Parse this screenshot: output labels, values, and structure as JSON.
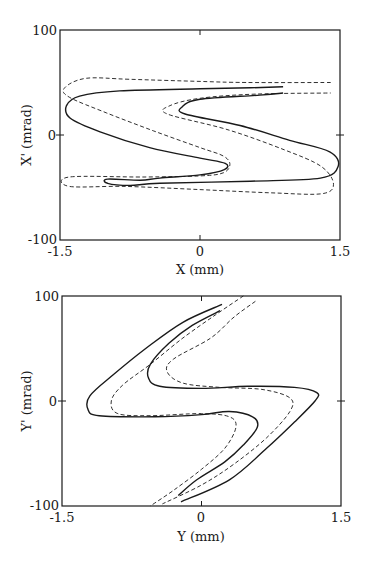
{
  "chart_data": [
    {
      "type": "line",
      "title": "",
      "xlabel": "X (mm)",
      "ylabel": "X' (mrad)",
      "xlim": [
        -1.5,
        1.5
      ],
      "ylim": [
        -100,
        100
      ],
      "xticks": [
        -1.5,
        0,
        1.5
      ],
      "xtick_labels": [
        "-1.5",
        "0",
        "1.5"
      ],
      "yticks": [
        -100,
        0,
        100
      ],
      "ytick_labels": [
        "-100",
        "0",
        "100"
      ],
      "grid": false,
      "legend": "none",
      "series": [
        {
          "name": "solid",
          "style": "solid",
          "points": [
            [
              0.89,
              46
            ],
            [
              0.54,
              45
            ],
            [
              0.0,
              44
            ],
            [
              -0.86,
              42
            ],
            [
              -1.29,
              37
            ],
            [
              -1.43,
              28
            ],
            [
              -1.39,
              16
            ],
            [
              -1.07,
              3
            ],
            [
              -0.54,
              -12
            ],
            [
              0.0,
              -22
            ],
            [
              0.27,
              -27
            ],
            [
              0.26,
              -33
            ],
            [
              0.0,
              -38
            ],
            [
              -0.43,
              -41
            ],
            [
              -0.64,
              -43
            ],
            [
              -0.99,
              -42
            ],
            [
              -0.99,
              -46
            ],
            [
              -0.75,
              -48
            ],
            [
              -0.43,
              -46
            ],
            [
              0.54,
              -44
            ],
            [
              1.29,
              -41
            ],
            [
              1.48,
              -30
            ],
            [
              1.39,
              -16
            ],
            [
              0.96,
              -5
            ],
            [
              0.43,
              9
            ],
            [
              -0.16,
              20
            ],
            [
              -0.19,
              27
            ],
            [
              0.0,
              34
            ],
            [
              0.64,
              38
            ],
            [
              0.89,
              40
            ]
          ]
        },
        {
          "name": "dashed",
          "style": "dashed",
          "points": [
            [
              1.4,
              50
            ],
            [
              0.5,
              50
            ],
            [
              0.0,
              51
            ],
            [
              -0.75,
              53
            ],
            [
              -1.22,
              54
            ],
            [
              -1.45,
              45
            ],
            [
              -1.4,
              36
            ],
            [
              -1.0,
              21
            ],
            [
              -0.5,
              4
            ],
            [
              0.0,
              -12
            ],
            [
              0.25,
              -20
            ],
            [
              0.32,
              -28
            ],
            [
              0.25,
              -36
            ],
            [
              0.0,
              -39
            ],
            [
              -0.6,
              -40
            ],
            [
              -1.4,
              -40
            ],
            [
              -1.4,
              -49
            ],
            [
              -0.8,
              -49
            ],
            [
              0.0,
              -52
            ],
            [
              0.75,
              -55
            ],
            [
              1.3,
              -56
            ],
            [
              1.43,
              -47
            ],
            [
              1.3,
              -30
            ],
            [
              0.9,
              -14
            ],
            [
              0.3,
              5
            ],
            [
              -0.35,
              20
            ],
            [
              -0.32,
              28
            ],
            [
              0.0,
              35
            ],
            [
              0.6,
              39
            ],
            [
              1.4,
              40
            ]
          ]
        }
      ]
    },
    {
      "type": "line",
      "title": "",
      "xlabel": "Y (mm)",
      "ylabel": "Y' (mrad)",
      "xlim": [
        -1.5,
        1.5
      ],
      "ylim": [
        -100,
        100
      ],
      "xticks": [
        -1.5,
        0,
        1.5
      ],
      "xtick_labels": [
        "-1.5",
        "0",
        "1.5"
      ],
      "yticks": [
        -100,
        0,
        100
      ],
      "ytick_labels": [
        "-100",
        "0",
        "100"
      ],
      "grid": false,
      "legend": "none",
      "series": [
        {
          "name": "solid",
          "style": "solid",
          "points": [
            [
              0.22,
              92
            ],
            [
              -0.2,
              75
            ],
            [
              -0.6,
              50
            ],
            [
              -0.95,
              25
            ],
            [
              -1.2,
              5
            ],
            [
              -1.22,
              -8
            ],
            [
              -1.1,
              -14
            ],
            [
              -0.5,
              -15
            ],
            [
              0.0,
              -13
            ],
            [
              0.3,
              -10
            ],
            [
              0.55,
              -15
            ],
            [
              0.6,
              -25
            ],
            [
              0.45,
              -42
            ],
            [
              0.25,
              -58
            ],
            [
              -0.05,
              -75
            ],
            [
              -0.25,
              -90
            ]
          ]
        },
        {
          "name": "solid-2",
          "style": "solid",
          "points": [
            [
              0.2,
              86
            ],
            [
              -0.1,
              72
            ],
            [
              -0.35,
              55
            ],
            [
              -0.55,
              35
            ],
            [
              -0.57,
              22
            ],
            [
              -0.45,
              14
            ],
            [
              0.0,
              12
            ],
            [
              0.5,
              14
            ],
            [
              1.0,
              13
            ],
            [
              1.24,
              8
            ],
            [
              1.22,
              0
            ],
            [
              1.0,
              -20
            ],
            [
              0.7,
              -45
            ],
            [
              0.3,
              -75
            ],
            [
              -0.22,
              -96
            ]
          ]
        },
        {
          "name": "dashed",
          "style": "dashed",
          "points": [
            [
              0.45,
              100
            ],
            [
              0.15,
              82
            ],
            [
              -0.2,
              60
            ],
            [
              -0.55,
              35
            ],
            [
              -0.85,
              15
            ],
            [
              -0.97,
              0
            ],
            [
              -0.9,
              -12
            ],
            [
              -0.55,
              -14
            ],
            [
              0.0,
              -12
            ],
            [
              0.3,
              -15
            ],
            [
              0.37,
              -25
            ],
            [
              0.25,
              -45
            ],
            [
              0.0,
              -65
            ],
            [
              -0.3,
              -85
            ],
            [
              -0.55,
              -100
            ]
          ]
        },
        {
          "name": "dashed-2",
          "style": "dashed",
          "points": [
            [
              0.58,
              95
            ],
            [
              0.35,
              80
            ],
            [
              0.1,
              60
            ],
            [
              -0.3,
              40
            ],
            [
              -0.37,
              28
            ],
            [
              -0.2,
              17
            ],
            [
              0.2,
              13
            ],
            [
              0.65,
              11
            ],
            [
              0.95,
              3
            ],
            [
              0.95,
              -10
            ],
            [
              0.7,
              -35
            ],
            [
              0.35,
              -60
            ],
            [
              0.0,
              -80
            ],
            [
              -0.42,
              -98
            ]
          ]
        }
      ]
    }
  ]
}
